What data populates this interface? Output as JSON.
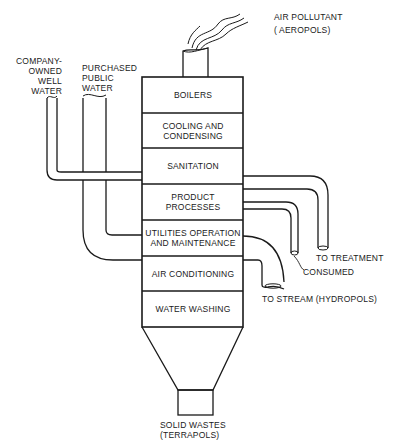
{
  "diagram": {
    "type": "process-flow",
    "tower_sections": [
      {
        "id": "boilers",
        "label": "BOILERS"
      },
      {
        "id": "cooling",
        "label_lines": [
          "COOLING AND",
          "CONDENSING"
        ]
      },
      {
        "id": "sanitation",
        "label": "SANITATION"
      },
      {
        "id": "product",
        "label": "PRODUCT PROCESSES"
      },
      {
        "id": "utilities",
        "label_lines": [
          "UTILITIES OPERATION",
          "AND MAINTENANCE"
        ]
      },
      {
        "id": "aircond",
        "label": "AIR CONDITIONING"
      },
      {
        "id": "washing",
        "label": "WATER WASHING"
      }
    ],
    "inputs": [
      {
        "id": "well",
        "label_lines": [
          "COMPANY-",
          "OWNED",
          "WELL",
          "WATER"
        ]
      },
      {
        "id": "public",
        "label_lines": [
          "PURCHASED",
          "PUBLIC",
          "WATER"
        ]
      }
    ],
    "outputs": {
      "air": {
        "label_lines": [
          "AIR POLLUTANT",
          "( AEROPOLS)"
        ]
      },
      "treatment": {
        "label": "TO TREATMENT"
      },
      "consumed": {
        "label": "CONSUMED"
      },
      "stream": {
        "label": "TO STREAM (HYDROPOLS)"
      },
      "solid": {
        "label_lines": [
          "SOLID WASTES",
          "(TERRAPOLS)"
        ]
      }
    },
    "colors": {
      "line": "#1a1a1a",
      "background": "#ffffff"
    }
  }
}
